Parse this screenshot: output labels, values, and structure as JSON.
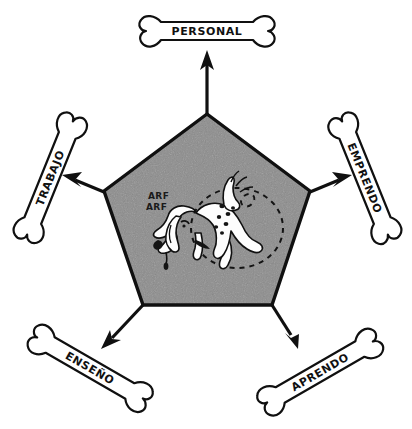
{
  "diagram": {
    "center": {
      "shape": "pentagon",
      "fill_color": "#8b8b8b",
      "outline_color": "#101010",
      "illustration": "dog-chasing-tail",
      "sound_effect_lines": [
        "ARF",
        "ARF"
      ],
      "motion_trail": "dashed-circle"
    },
    "nodes": [
      {
        "id": "personal",
        "label": "PERSONAL",
        "shape": "bone",
        "position": "top",
        "rotation_deg": 0,
        "arrow_direction": "up"
      },
      {
        "id": "emprendo",
        "label": "EMPRENDO",
        "shape": "bone",
        "position": "top-right",
        "rotation_deg": 68,
        "arrow_direction": "up-right"
      },
      {
        "id": "aprendo",
        "label": "APRENDO",
        "shape": "bone",
        "position": "bottom-right",
        "rotation_deg": -30,
        "arrow_direction": "down-right"
      },
      {
        "id": "enseno",
        "label": "ENSEÑO",
        "shape": "bone",
        "position": "bottom-left",
        "rotation_deg": 30,
        "arrow_direction": "down-left"
      },
      {
        "id": "trabajo",
        "label": "TRABAJO",
        "shape": "bone",
        "position": "top-left",
        "rotation_deg": -68,
        "arrow_direction": "up-left"
      }
    ],
    "palette": {
      "ink": "#101010",
      "paper": "#ffffff",
      "pentagon_gray": "#8b8b8b"
    }
  }
}
